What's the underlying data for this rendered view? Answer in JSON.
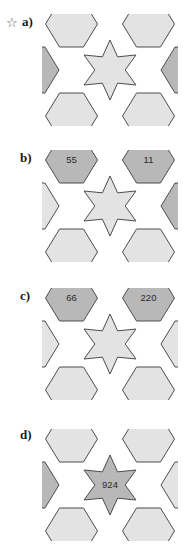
{
  "page": {
    "background_color": "#ffffff"
  },
  "style": {
    "hex_light_fill": "#e3e3e3",
    "hex_shaded_fill": "#b8b8b8",
    "star_light_fill": "#e3e3e3",
    "star_shaded_fill": "#b8b8b8",
    "stroke_color": "#4d4d4d",
    "text_color": "#2b2b2b"
  },
  "problems": [
    {
      "id": "a",
      "label": "a)",
      "starred": true,
      "star_glyph": "☆",
      "center": {
        "value": "",
        "shaded": false
      },
      "cells": [
        {
          "position": "top-left",
          "value": "",
          "shaded": false
        },
        {
          "position": "top-right",
          "value": "",
          "shaded": false
        },
        {
          "position": "right",
          "value": "1",
          "shaded": true
        },
        {
          "position": "bottom-right",
          "value": "",
          "shaded": false
        },
        {
          "position": "bottom-left",
          "value": "",
          "shaded": false
        },
        {
          "position": "left",
          "value": "28",
          "shaded": true
        }
      ]
    },
    {
      "id": "b",
      "label": "b)",
      "starred": false,
      "star_glyph": "",
      "center": {
        "value": "",
        "shaded": false
      },
      "cells": [
        {
          "position": "top-left",
          "value": "55",
          "shaded": true
        },
        {
          "position": "top-right",
          "value": "11",
          "shaded": true
        },
        {
          "position": "right",
          "value": "12",
          "shaded": true
        },
        {
          "position": "bottom-right",
          "value": "",
          "shaded": false
        },
        {
          "position": "bottom-left",
          "value": "",
          "shaded": false
        },
        {
          "position": "left",
          "value": "",
          "shaded": false
        }
      ]
    },
    {
      "id": "c",
      "label": "c)",
      "starred": false,
      "star_glyph": "",
      "center": {
        "value": "",
        "shaded": false
      },
      "cells": [
        {
          "position": "top-left",
          "value": "66",
          "shaded": true
        },
        {
          "position": "top-right",
          "value": "220",
          "shaded": true
        },
        {
          "position": "right",
          "value": "",
          "shaded": false
        },
        {
          "position": "bottom-right",
          "value": "",
          "shaded": false
        },
        {
          "position": "bottom-left",
          "value": "",
          "shaded": false
        },
        {
          "position": "left",
          "value": "",
          "shaded": false
        }
      ]
    },
    {
      "id": "d",
      "label": "d)",
      "starred": false,
      "star_glyph": "",
      "center": {
        "value": "924",
        "shaded": true
      },
      "cells": [
        {
          "position": "top-left",
          "value": "",
          "shaded": false
        },
        {
          "position": "top-right",
          "value": "",
          "shaded": false
        },
        {
          "position": "right",
          "value": "",
          "shaded": false
        },
        {
          "position": "bottom-right",
          "value": "",
          "shaded": false
        },
        {
          "position": "bottom-left",
          "value": "",
          "shaded": false
        },
        {
          "position": "left",
          "value": "792",
          "shaded": true
        }
      ]
    }
  ]
}
